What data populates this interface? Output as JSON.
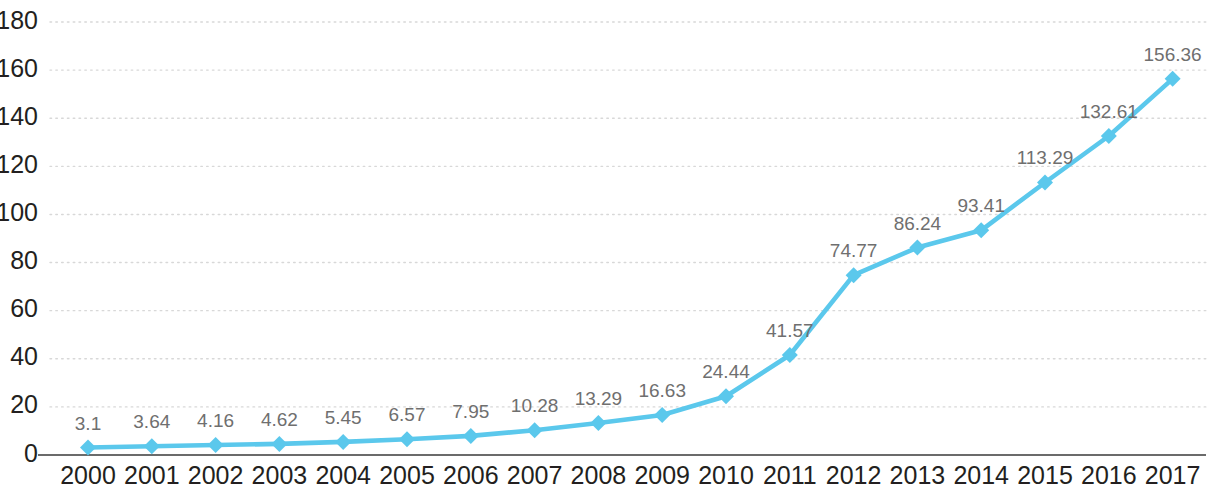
{
  "chart_data": {
    "type": "line",
    "title": "",
    "subtitle": "",
    "xlabel": "",
    "ylabel": "",
    "categories": [
      "2000",
      "2001",
      "2002",
      "2003",
      "2004",
      "2005",
      "2006",
      "2007",
      "2008",
      "2009",
      "2010",
      "2011",
      "2012",
      "2013",
      "2014",
      "2015",
      "2016",
      "2017"
    ],
    "values": [
      3.1,
      3.64,
      4.16,
      4.62,
      5.45,
      6.57,
      7.95,
      10.28,
      13.29,
      16.63,
      24.44,
      41.57,
      74.77,
      86.24,
      93.41,
      113.29,
      132.61,
      156.36
    ],
    "point_labels": [
      "3.1",
      "3.64",
      "4.16",
      "4.62",
      "5.45",
      "6.57",
      "7.95",
      "10.28",
      "13.29",
      "16.63",
      "24.44",
      "41.57",
      "74.77",
      "86.24",
      "93.41",
      "113.29",
      "132.61",
      "156.36"
    ],
    "series": [
      {
        "name": "",
        "values": [
          3.1,
          3.64,
          4.16,
          4.62,
          5.45,
          6.57,
          7.95,
          10.28,
          13.29,
          16.63,
          24.44,
          41.57,
          74.77,
          86.24,
          93.41,
          113.29,
          132.61,
          156.36
        ]
      }
    ],
    "ylim": [
      0,
      180
    ],
    "yticks": [
      0,
      20,
      40,
      60,
      80,
      100,
      120,
      140,
      160,
      180
    ],
    "ytick_labels": [
      "0",
      "20",
      "40",
      "60",
      "80",
      "100",
      "120",
      "140",
      "160",
      "180"
    ],
    "grid": true,
    "grid_axis": "y",
    "legend": false,
    "legend_position": "none",
    "marker": "diamond",
    "colors": {
      "series_line": "#5BC8EC",
      "marker_fill": "#5BC8EC",
      "gridline": "#d8d8d8",
      "axis_line": "#6b6b6b",
      "tick_text": "#231f20",
      "data_label_text": "#6f6f6f",
      "background": "#ffffff"
    }
  },
  "layout": {
    "plot_left": 50,
    "plot_right": 1206,
    "plot_top": 22,
    "plot_bottom": 455,
    "first_point_x": 88,
    "point_spacing": 63.8,
    "y_pixels_per_unit": 2.405,
    "label_offset_y": -18,
    "x_axis_label_y": 466
  }
}
